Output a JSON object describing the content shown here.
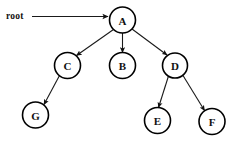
{
  "diagram": {
    "type": "tree",
    "background_color": "#ffffff",
    "stroke_color": "#111111",
    "node_fill_color": "#ffffff",
    "root_pointer": {
      "label": "root",
      "label_x": 6,
      "label_y": 16,
      "line_x1": 32,
      "line_y1": 16.5,
      "line_x2": 108,
      "line_y2": 16.5,
      "target": "A"
    },
    "nodes": [
      {
        "id": "A",
        "label": "A",
        "cx": 122.5,
        "cy": 20,
        "r": 13
      },
      {
        "id": "C",
        "label": "C",
        "cx": 67.5,
        "cy": 65.5,
        "r": 13
      },
      {
        "id": "B",
        "label": "B",
        "cx": 122.5,
        "cy": 65.5,
        "r": 13
      },
      {
        "id": "D",
        "label": "D",
        "cx": 175,
        "cy": 65.5,
        "r": 12.5
      },
      {
        "id": "G",
        "label": "G",
        "cx": 35.5,
        "cy": 115,
        "r": 13
      },
      {
        "id": "E",
        "label": "E",
        "cx": 157.5,
        "cy": 120.5,
        "r": 13
      },
      {
        "id": "F",
        "label": "F",
        "cx": 212,
        "cy": 121.5,
        "r": 13
      }
    ],
    "edges": [
      {
        "from": "A",
        "to": "C",
        "x1": 113.5,
        "y1": 29.5,
        "x2": 76.5,
        "y2": 55.5
      },
      {
        "from": "A",
        "to": "B",
        "x1": 122.5,
        "y1": 33,
        "x2": 122.5,
        "y2": 52.5
      },
      {
        "from": "A",
        "to": "D",
        "x1": 132,
        "y1": 29,
        "x2": 167,
        "y2": 55
      },
      {
        "from": "C",
        "to": "G",
        "x1": 59.5,
        "y1": 75.5,
        "x2": 44,
        "y2": 104.5
      },
      {
        "from": "D",
        "to": "E",
        "x1": 168.5,
        "y1": 76,
        "x2": 158.5,
        "y2": 107.5
      },
      {
        "from": "D",
        "to": "F",
        "x1": 183,
        "y1": 75.5,
        "x2": 204.5,
        "y2": 110.5
      }
    ]
  }
}
